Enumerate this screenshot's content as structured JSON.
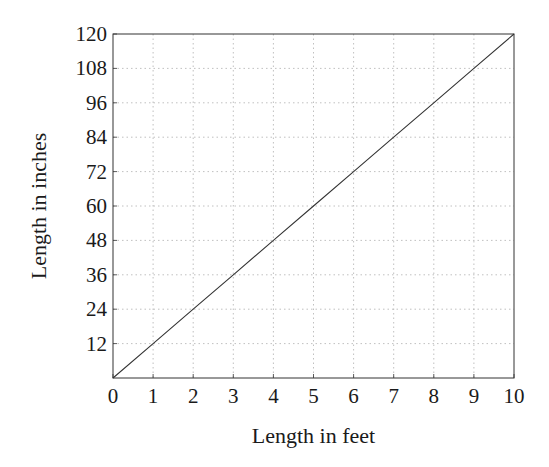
{
  "chart_data": {
    "type": "line",
    "title": "",
    "xlabel": "Length in feet",
    "ylabel": "Length in inches",
    "xlim": [
      0,
      10
    ],
    "ylim": [
      0,
      120
    ],
    "x_ticks": [
      0,
      1,
      2,
      3,
      4,
      5,
      6,
      7,
      8,
      9,
      10
    ],
    "y_ticks": [
      12,
      24,
      36,
      48,
      60,
      72,
      84,
      96,
      108,
      120
    ],
    "grid": true,
    "grid_style": "dotted",
    "legend": null,
    "series": [
      {
        "name": "inches = 12 × feet",
        "x": [
          0,
          1,
          2,
          3,
          4,
          5,
          6,
          7,
          8,
          9,
          10
        ],
        "y": [
          0,
          12,
          24,
          36,
          48,
          60,
          72,
          84,
          96,
          108,
          120
        ],
        "color": "#333333"
      }
    ]
  },
  "colors": {
    "line": "#333333",
    "frame": "#333333",
    "grid": "#b0b0b0",
    "text": "#1a1a1a"
  }
}
